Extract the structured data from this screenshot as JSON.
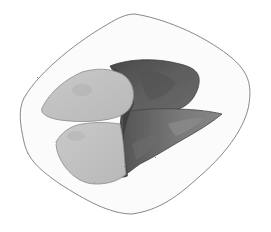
{
  "image": {
    "description": "Grayscale watercolor sketch of roasted food pieces on a rounded square plate",
    "style": "watercolor pencil sketch",
    "colors": {
      "background": "#ffffff",
      "plate_fill": "#fafafa",
      "plate_outline": "#6e6e6e",
      "light_piece": "#c4c4c4",
      "light_piece_shade": "#b2b2b2",
      "dark_piece_top": "#5c5c5c",
      "dark_piece_mid": "#6a6a6a",
      "dark_piece_bottom": "#7d7d7d",
      "skin_edge": "#3e3e3e"
    }
  }
}
